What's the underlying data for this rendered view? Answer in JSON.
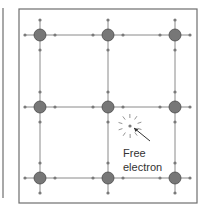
{
  "diagram": {
    "title": "",
    "left_panel_edge": {
      "x": 3,
      "y1": 8,
      "y2": 198
    },
    "box": {
      "x": 19,
      "y": 9,
      "width": 178,
      "height": 194
    },
    "colors": {
      "border": "#6e6e6e",
      "ion_fill": "#777777",
      "ion_stroke": "#4a4a4a",
      "bond": "#8a8a8a",
      "dot": "#7a7a7a",
      "ray": "#888888",
      "arrow": "#333333"
    },
    "columns": [
      40,
      108,
      175
    ],
    "rows": [
      35,
      107,
      178
    ],
    "ion_radius": 6,
    "dot_radius": 1.6,
    "dot_offset": 15,
    "free_electron": {
      "x": 130,
      "y": 126,
      "arrow_from": [
        150,
        141
      ],
      "arrow_to": [
        134,
        128
      ],
      "label_lines": [
        "Free",
        "electron"
      ],
      "label_x": 123,
      "label_y": [
        157,
        171
      ]
    }
  }
}
